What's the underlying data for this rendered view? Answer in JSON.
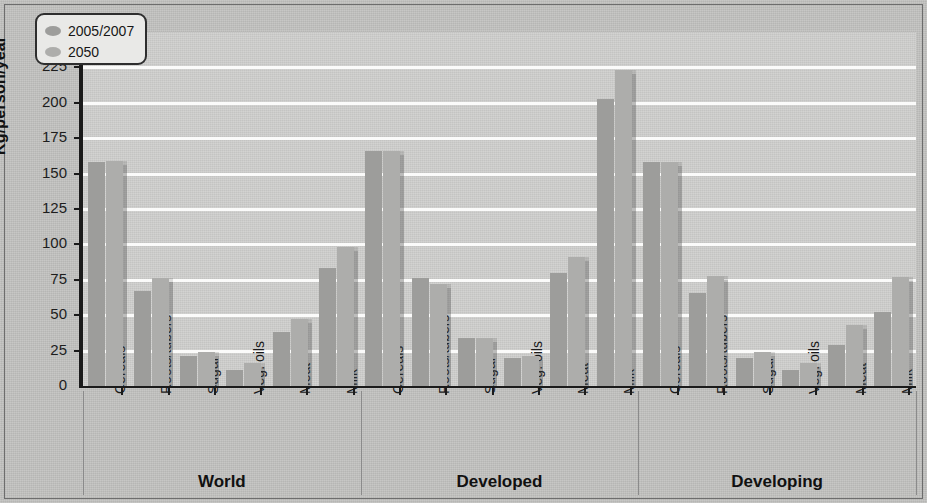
{
  "chart_data": {
    "type": "bar",
    "title": "",
    "xlabel": "",
    "ylabel": "Kg/person/year",
    "ylim": [
      0,
      250
    ],
    "ytick_step": 25,
    "yticks": [
      0,
      25,
      50,
      75,
      100,
      125,
      150,
      175,
      200,
      225,
      250
    ],
    "grid": true,
    "legend_position": "top-left",
    "categories": [
      "Cereals",
      "Roots/tubers",
      "Sugar",
      "Veg. oils",
      "Meat",
      "Milk"
    ],
    "groups": [
      "World",
      "Developed",
      "Developing"
    ],
    "series": [
      {
        "name": "2005/2007",
        "color": "#9d9d9b",
        "values_by_group": {
          "World": [
            158,
            67,
            21,
            11,
            38,
            83
          ],
          "Developed": [
            166,
            76,
            34,
            20,
            80,
            203
          ],
          "Developing": [
            158,
            66,
            20,
            11,
            29,
            52
          ]
        }
      },
      {
        "name": "2050",
        "color": "#adadab",
        "values_by_group": {
          "World": [
            159,
            76,
            24,
            16,
            47,
            98
          ],
          "Developed": [
            166,
            72,
            34,
            21,
            91,
            223
          ],
          "Developing": [
            158,
            78,
            24,
            16,
            43,
            77
          ]
        }
      }
    ],
    "legend": [
      "2005/2007",
      "2050"
    ]
  },
  "legend": {
    "item1_label": "2005/2007",
    "item2_label": "2050"
  },
  "axis": {
    "ylabel": "Kg/person/year",
    "tick_250": "250",
    "tick_225": "225",
    "tick_200": "200",
    "tick_175": "175",
    "tick_150": "150",
    "tick_125": "125",
    "tick_100": "100",
    "tick_75": "75",
    "tick_50": "50",
    "tick_25": "25",
    "tick_0": "0"
  },
  "groups": {
    "g0_label": "World",
    "g1_label": "Developed",
    "g2_label": "Developing"
  },
  "colors": {
    "series1": "#9d9d9b",
    "series2": "#adadab",
    "plot_background": "#cfcfcd",
    "page_background": "#c3c3c1",
    "gridline": "#fbfbfa",
    "axis": "#1b1b1b"
  }
}
